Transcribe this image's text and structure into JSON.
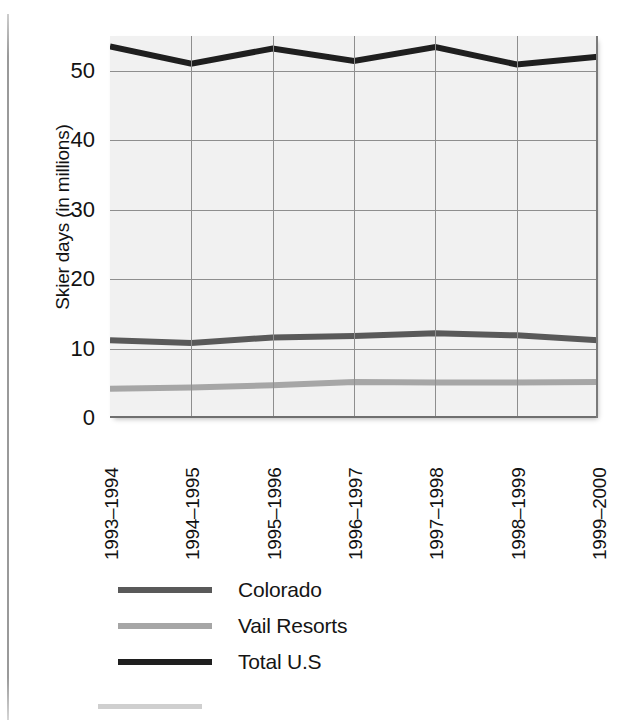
{
  "chart_data": {
    "type": "line",
    "title": "",
    "xlabel": "",
    "ylabel": "Skier days (in millions)",
    "categories": [
      "1993–1994",
      "1994–1995",
      "1995–1996",
      "1996–1997",
      "1997–1998",
      "1998–1999",
      "1999–2000"
    ],
    "ylim": [
      0,
      55
    ],
    "yticks": [
      0,
      10,
      20,
      30,
      40,
      50
    ],
    "ytick_labels": [
      "0",
      "10",
      "20",
      "30",
      "40",
      "50"
    ],
    "grid": true,
    "legend_position": "below-plot",
    "series": [
      {
        "name": "Colorado",
        "color": "#595959",
        "values": [
          11.2,
          10.8,
          11.6,
          11.8,
          12.2,
          11.9,
          11.2
        ]
      },
      {
        "name": "Vail Resorts",
        "color": "#a6a6a6",
        "values": [
          4.2,
          4.4,
          4.7,
          5.2,
          5.1,
          5.1,
          5.2
        ]
      },
      {
        "name": "Total U.S",
        "color": "#1f1f1f",
        "values": [
          53.5,
          51.0,
          53.2,
          51.4,
          53.4,
          50.9,
          52.0
        ]
      }
    ]
  },
  "axis": {
    "y_title": "Skier days (in millions)"
  },
  "legend": {
    "items": [
      {
        "label": "Colorado",
        "color": "#595959"
      },
      {
        "label": "Vail Resorts",
        "color": "#a6a6a6"
      },
      {
        "label": "Total U.S",
        "color": "#1f1f1f"
      }
    ]
  }
}
